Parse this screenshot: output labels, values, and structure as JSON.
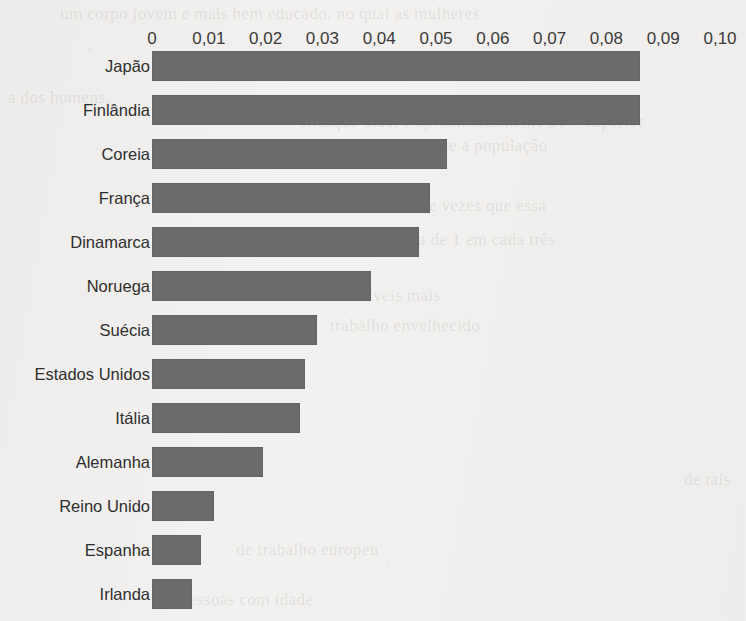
{
  "chart_data": {
    "type": "bar",
    "orientation": "horizontal",
    "title": "",
    "subtitle": "",
    "xlabel": "",
    "ylabel": "",
    "categories": [
      "Japão",
      "Finlândia",
      "Coreia",
      "França",
      "Dinamarca",
      "Noruega",
      "Suécia",
      "Estados Unidos",
      "Itália",
      "Alemanha",
      "Reino Unido",
      "Espanha",
      "Irlanda"
    ],
    "values": [
      0.086,
      0.086,
      0.052,
      0.049,
      0.047,
      0.0385,
      0.029,
      0.027,
      0.026,
      0.0195,
      0.011,
      0.0086,
      0.007
    ],
    "xlim": [
      0,
      0.1
    ],
    "xticks": [
      0,
      0.01,
      0.02,
      0.03,
      0.04,
      0.05,
      0.06,
      0.07,
      0.08,
      0.09,
      0.1
    ],
    "xtick_labels": [
      "0",
      "0,01",
      "0,02",
      "0,03",
      "0,04",
      "0,05",
      "0,06",
      "0,07",
      "0,08",
      "0,09",
      "0,10"
    ],
    "grid": false,
    "legend": null,
    "decimal_separator": ",",
    "bar_color": "#6b6b6b",
    "background_color": "#f2f1ef",
    "text_color": "#2e2e2e"
  },
  "layout": {
    "axis_left_px": 152,
    "axis_right_px": 720,
    "row_pitch_px": 44,
    "bar_height_px": 30,
    "plot_top_px": 51
  },
  "background_bleed_text": [
    {
      "text": "um corpo jovem e mais bem educado, no qual as mulheres",
      "x": 60,
      "y": 4
    },
    {
      "text": "a dos homens.",
      "x": 8,
      "y": 88
    },
    {
      "text": "situação atual é aproximadamente 20% superior",
      "x": 300,
      "y": 112
    },
    {
      "text": "sobre a população",
      "x": 418,
      "y": 136
    },
    {
      "text": "de vezes que essa",
      "x": 420,
      "y": 196
    },
    {
      "text": "era de 1 em cada três",
      "x": 404,
      "y": 230
    },
    {
      "text": "e os níveis mais",
      "x": 326,
      "y": 286
    },
    {
      "text": "trabalho envelhecido",
      "x": 330,
      "y": 316
    },
    {
      "text": "de tais",
      "x": 684,
      "y": 470
    },
    {
      "text": "de trabalho europeu",
      "x": 236,
      "y": 540
    },
    {
      "text": "pessoas com idade",
      "x": 180,
      "y": 590
    }
  ]
}
